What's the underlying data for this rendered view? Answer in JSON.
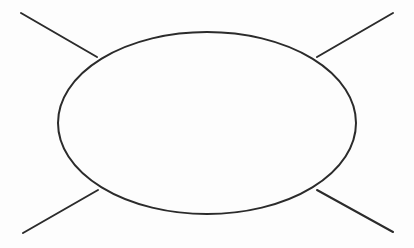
{
  "canvas": {
    "width": 414,
    "height": 248,
    "background_color": "#fdfdfd",
    "stroke_color": "#2b2b2b",
    "stroke_width": 2,
    "fill_color": "#fdfdfd"
  },
  "diagram": {
    "title": "",
    "shapes": {
      "ellipse": {
        "name": "central-ellipse",
        "cx": 207,
        "cy": 123,
        "rx": 149,
        "ry": 91
      },
      "lines": [
        {
          "name": "line-top-left",
          "x1": 21,
          "y1": 13,
          "x2": 97,
          "y2": 57
        },
        {
          "name": "line-top-right",
          "x1": 393,
          "y1": 13,
          "x2": 317,
          "y2": 57
        },
        {
          "name": "line-bottom-left",
          "x1": 23,
          "y1": 233,
          "x2": 98,
          "y2": 190
        },
        {
          "name": "line-bottom-right",
          "x1": 393,
          "y1": 232,
          "x2": 317,
          "y2": 190
        }
      ]
    },
    "labels": []
  }
}
